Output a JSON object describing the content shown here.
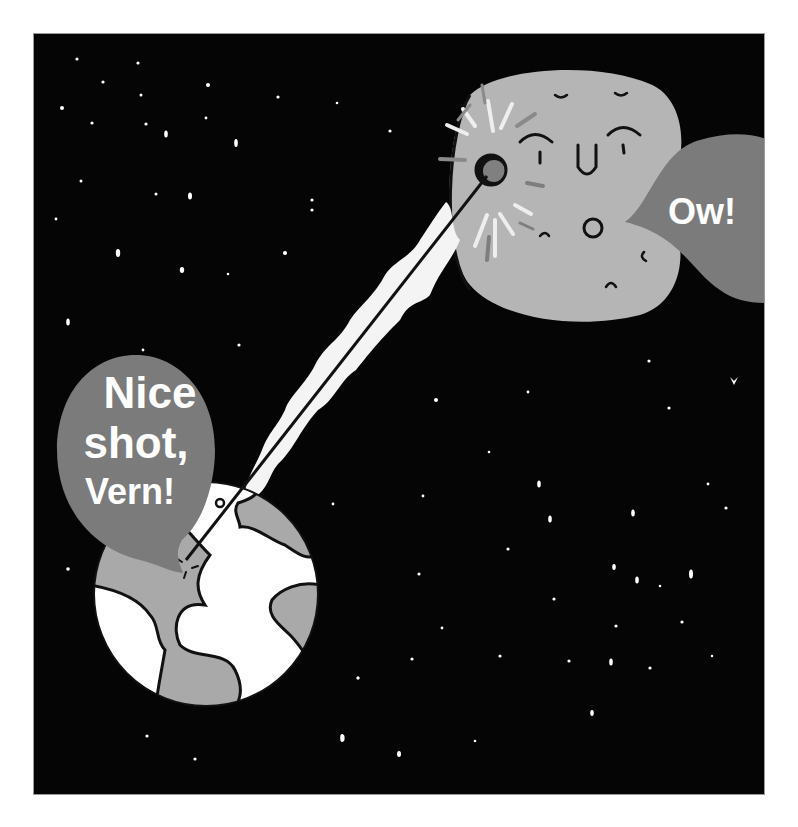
{
  "illustration": {
    "background_color": "#050505",
    "panel_border_color": "#9a9a9a",
    "earth": {
      "ocean_color": "#ffffff",
      "land_color": "#a9a9a9",
      "outline_color": "#111111",
      "speech_bubble": {
        "lines": [
          "Nice",
          "shot,",
          "Vern!"
        ],
        "fill": "#7b7b7b",
        "text_color": "#ffffff"
      }
    },
    "moon": {
      "fill": "#b5b5b5",
      "impact_spot_color": "#808080",
      "speech_bubble": {
        "text": "Ow!",
        "fill": "#7b7b7b",
        "text_color": "#ffffff"
      }
    },
    "beam": {
      "glow_color": "#f4f4f4",
      "line_color": "#111111"
    }
  }
}
